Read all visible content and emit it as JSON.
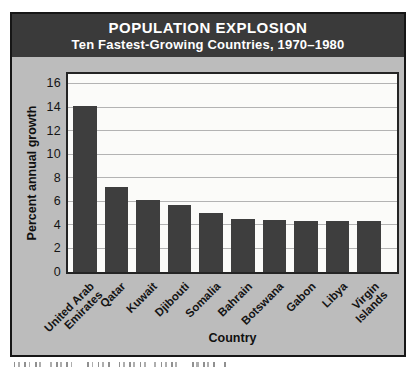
{
  "figure": {
    "border_color": "#161616",
    "panel_color": "#bcbcbc",
    "header": {
      "background": "#3a3a3a",
      "text_color": "#ffffff"
    },
    "cropped_caption_visible": true
  },
  "chart_data": {
    "type": "bar",
    "title": "POPULATION EXPLOSION",
    "subtitle": "Ten Fastest-Growing Countries, 1970–1980",
    "categories": [
      "United Arab Emirates",
      "Qatar",
      "Kuwait",
      "Djibouti",
      "Somalia",
      "Bahrain",
      "Botswana",
      "Gabon",
      "Libya",
      "Virgin Islands"
    ],
    "category_lines": [
      [
        "United Arab",
        "Emirates"
      ],
      [
        "Qatar"
      ],
      [
        "Kuwait"
      ],
      [
        "Djibouti"
      ],
      [
        "Somalia"
      ],
      [
        "Bahrain"
      ],
      [
        "Botswana"
      ],
      [
        "Gabon"
      ],
      [
        "Libya"
      ],
      [
        "Virgin",
        "Islands"
      ]
    ],
    "values": [
      14.1,
      7.2,
      6.1,
      5.7,
      5.0,
      4.5,
      4.4,
      4.3,
      4.3,
      4.3
    ],
    "xlabel": "Country",
    "ylabel": "Percent annual growth",
    "ylim": [
      0,
      16.8
    ],
    "yticks": [
      0,
      2,
      4,
      6,
      8,
      10,
      12,
      14,
      16
    ],
    "grid": true,
    "legend": false,
    "bar_color": "#3e3e3e",
    "plot_background": "#fbfbf9",
    "gridline_color": "#b3b3b3",
    "axis_color": "#242424"
  }
}
